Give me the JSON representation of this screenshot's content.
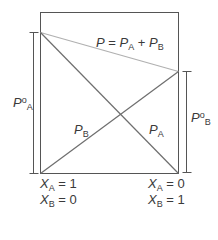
{
  "diagram": {
    "type": "vapor-pressure-diagram",
    "colors": {
      "box": "#555555",
      "component_lines": "#6e6e6e",
      "total_line": "#b0b0b0",
      "text": "#3a3a3a"
    },
    "labels": {
      "total_equation": {
        "P": "P",
        "eq": " = ",
        "PA": "P",
        "A": "A",
        "plus": " + ",
        "PB": "P",
        "B": "B"
      },
      "pA_line": {
        "P": "P",
        "sub": "A"
      },
      "pB_line": {
        "P": "P",
        "sub": "B"
      },
      "pure_A": {
        "P": "P",
        "sup": "o",
        "sub": "A"
      },
      "pure_B": {
        "P": "P",
        "sup": "o",
        "sub": "B"
      },
      "left_axis": {
        "xa": {
          "X": "X",
          "sub": "A",
          "value": " = 1"
        },
        "xb": {
          "X": "X",
          "sub": "B",
          "value": " = 0"
        }
      },
      "right_axis": {
        "xa": {
          "X": "X",
          "sub": "A",
          "value": " = 0"
        },
        "xb": {
          "X": "X",
          "sub": "B",
          "value": " = 1"
        }
      }
    }
  }
}
